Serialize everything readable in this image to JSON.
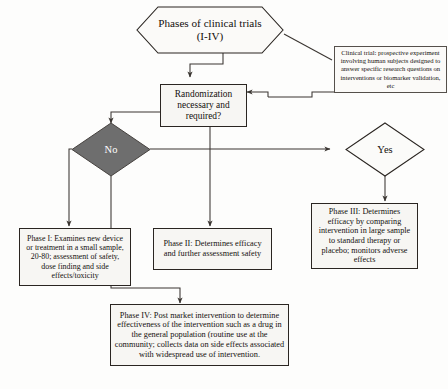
{
  "diagram": {
    "type": "flowchart",
    "colors": {
      "background": "#fdfdfc",
      "node_fill": "#f7f6f3",
      "node_stroke": "#2a2521",
      "decision_no_fill": "#6e6e6e",
      "decision_no_text": "#ffffff",
      "decision_yes_fill": "#fbfbf9",
      "line": "#3a3531",
      "text": "#14100e"
    }
  },
  "nodes": {
    "title": {
      "shape": "hexagon",
      "line1": "Phases of clinical trials",
      "line2": "(I-IV)"
    },
    "decision": {
      "shape": "process",
      "text": "Randomization necessary and required?"
    },
    "note": {
      "shape": "annotation",
      "text": "Clinical trial: prospective experiment involving human subjects designed to answer specific research questions on interventions or biomarker validation, etc"
    },
    "no": {
      "shape": "diamond",
      "label": "No"
    },
    "yes": {
      "shape": "diamond",
      "label": "Yes"
    },
    "phase1": {
      "shape": "process",
      "text": "Phase I: Examines new device or treatment in a small sample, 20-80; assessment of safety, dose finding and side effects/toxicity"
    },
    "phase2": {
      "shape": "process",
      "text": "Phase II: Determines efficacy and further assessment safety"
    },
    "phase3": {
      "shape": "process",
      "text": "Phase III: Determines efficacy by comparing intervention in large sample to standard therapy or placebo; monitors adverse effects"
    },
    "phase4": {
      "shape": "process",
      "text": "Phase IV: Post market intervention to determine effectiveness of the intervention such as a drug in the general population (routine use at the community; collects data on side effects associated with widespread use of intervention."
    }
  },
  "edges": [
    {
      "from": "title",
      "to": "decision",
      "arrow": true
    },
    {
      "from": "title",
      "to": "note",
      "arrow": false
    },
    {
      "from": "note",
      "to": "decision",
      "arrow": true
    },
    {
      "from": "decision",
      "to": "no",
      "arrow": true
    },
    {
      "from": "decision",
      "to": "phase2",
      "arrow": true
    },
    {
      "from": "no",
      "to": "yes",
      "arrow": true
    },
    {
      "from": "no",
      "to": "phase1",
      "arrow": true
    },
    {
      "from": "no",
      "to": "phase4",
      "arrow": true
    },
    {
      "from": "yes",
      "to": "phase3",
      "arrow": true
    }
  ]
}
